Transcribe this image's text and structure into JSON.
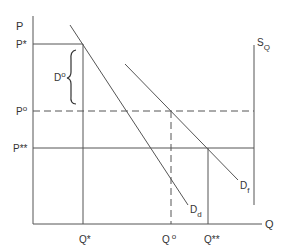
{
  "diagram": {
    "axes": {
      "y_label": "P",
      "x_label": "Q"
    },
    "price_labels": {
      "p_star": "P*",
      "p_zero": "P",
      "p_zero_sup": "o",
      "p_double_star": "P**"
    },
    "quantity_labels": {
      "q_star": "Q*",
      "q_zero": "Q",
      "q_zero_sup": "o",
      "q_double_star": "Q**"
    },
    "curves": {
      "domestic_demand": {
        "base": "D",
        "sub": "d"
      },
      "foreign_demand": {
        "base": "D",
        "sub": "f"
      },
      "quota_supply": {
        "base": "S",
        "sub": "Q"
      }
    },
    "brace": {
      "base": "D",
      "sup": "o"
    },
    "colors": {
      "line": "#555555",
      "text": "#333333",
      "background": "#ffffff"
    }
  }
}
